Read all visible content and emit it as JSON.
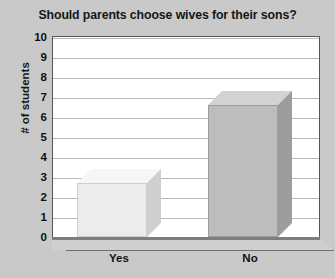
{
  "chart_data": {
    "type": "bar",
    "title": "Should parents choose wives for their sons?",
    "xlabel": "",
    "ylabel": "# of students",
    "categories": [
      "Yes",
      "No"
    ],
    "values": [
      2.7,
      6.6
    ],
    "ylim": [
      0,
      10
    ],
    "ytick_labels": [
      "10",
      "9",
      "8",
      "7",
      "6",
      "5",
      "4",
      "3",
      "2",
      "1",
      "0"
    ],
    "ytick_values": [
      10,
      9,
      8,
      7,
      6,
      5,
      4,
      3,
      2,
      1,
      0
    ],
    "grid": true,
    "legend": false,
    "style": "3d-column",
    "series": [
      {
        "name": "# of students",
        "values": [
          2.7,
          6.6
        ],
        "bar_colors": [
          "#ececec",
          "#bdbdbd"
        ]
      }
    ],
    "colors": {
      "background": "#c9c9c9",
      "plot_background": "#ffffff",
      "plot_border": "#555555",
      "gridline": "#b9b9b9",
      "text": "#111111",
      "bar_yes_front": "#ececec",
      "bar_yes_top": "#f6f6f6",
      "bar_yes_side": "#cfcfcf",
      "bar_no_front": "#bdbdbd",
      "bar_no_top": "#d2d2d2",
      "bar_no_side": "#9d9d9d",
      "floor": "#cfcfcf"
    }
  }
}
